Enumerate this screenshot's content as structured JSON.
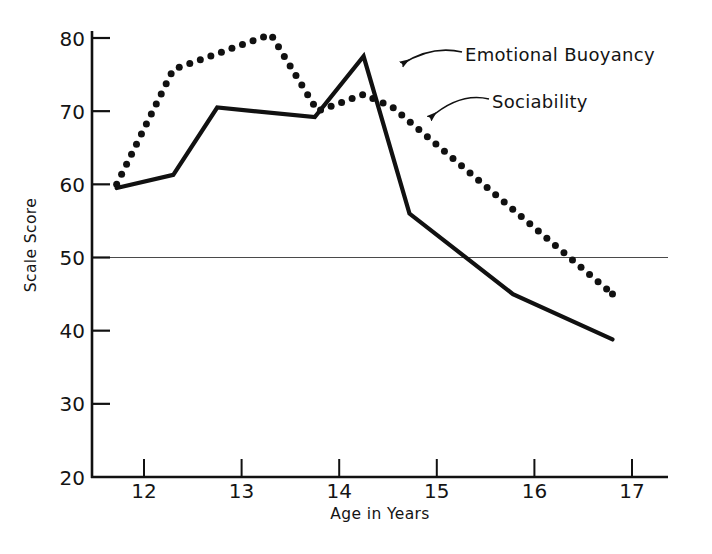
{
  "chart_data": {
    "type": "line",
    "title": "",
    "xlabel": "Age in Years",
    "ylabel": "Scale Score",
    "xlim": [
      11.55,
      17.1
    ],
    "ylim": [
      20,
      82
    ],
    "xticks": [
      12,
      13,
      14,
      15,
      16,
      17
    ],
    "xtick_labels": [
      "12",
      "13",
      "14",
      "15",
      "16",
      "17"
    ],
    "yticks": [
      20,
      30,
      40,
      50,
      60,
      70,
      80
    ],
    "ytick_labels": [
      "20",
      "30",
      "40",
      "50",
      "60",
      "70",
      "80"
    ],
    "grid": false,
    "reference_lines": [
      {
        "axis": "y",
        "value": 50,
        "style": "thin-solid"
      }
    ],
    "legend_position": "inline-annotated-arrows",
    "series": [
      {
        "name": "Emotional Buoyancy",
        "style": "solid",
        "linewidth": 4.2,
        "color": "#111111",
        "x": [
          11.72,
          12.3,
          12.75,
          13.75,
          14.25,
          14.72,
          15.78,
          16.8
        ],
        "y": [
          59.5,
          61.3,
          70.5,
          69.2,
          77.5,
          56.0,
          45.0,
          38.8
        ]
      },
      {
        "name": "Sociability",
        "style": "dotted",
        "linewidth": 4.2,
        "color": "#111111",
        "x": [
          11.72,
          12.3,
          13.3,
          13.78,
          14.25,
          14.55,
          16.8
        ],
        "y": [
          60.0,
          75.7,
          80.5,
          70.0,
          72.3,
          70.5,
          45.0
        ]
      }
    ],
    "annotations": [
      {
        "text": "Emotional Buoyancy",
        "text_x": 465,
        "text_y": 61,
        "arrow_tail_x": 462,
        "arrow_tail_y": 52,
        "arrow_head_x": 402,
        "arrow_head_y": 64
      },
      {
        "text": "Sociability",
        "text_x": 492,
        "text_y": 108,
        "arrow_tail_x": 489,
        "arrow_tail_y": 99,
        "arrow_head_x": 430,
        "arrow_head_y": 118
      }
    ]
  },
  "axis": {
    "x_label": "Age in Years",
    "y_label": "Scale Score"
  }
}
